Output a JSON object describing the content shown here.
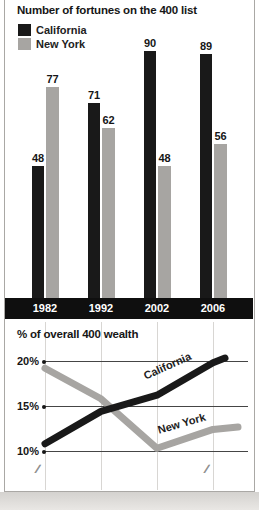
{
  "colors": {
    "california": "#191919",
    "new_york": "#a7a5a2",
    "band": "#0f0f0f",
    "grid_vertical": "#d8d6d3",
    "grid_horizontal": "#454545",
    "card_border": "#aaa8a5"
  },
  "bar_chart": {
    "title": "Number of fortunes on the 400 list",
    "legend": [
      {
        "label": "California"
      },
      {
        "label": "New York"
      }
    ],
    "years": [
      "1982",
      "1992",
      "2002",
      "2006"
    ],
    "california_values": [
      48,
      71,
      90,
      89
    ],
    "new_york_values": [
      77,
      62,
      48,
      56
    ]
  },
  "line_chart": {
    "title": "% of overall 400 wealth",
    "y_ticks": [
      "20%",
      "15%",
      "10%"
    ],
    "california_label": "California",
    "new_york_label": "New York",
    "california_pct": [
      10.8,
      14.4,
      16.2,
      19.8
    ],
    "new_york_pct": [
      19.2,
      15.8,
      10.3,
      12.4
    ],
    "axis_break": "∕∕"
  },
  "chart_data": [
    {
      "type": "bar",
      "title": "Number of fortunes on the 400 list",
      "categories": [
        "1982",
        "1992",
        "2002",
        "2006"
      ],
      "series": [
        {
          "name": "California",
          "values": [
            48,
            71,
            90,
            89
          ],
          "color": "#191919"
        },
        {
          "name": "New York",
          "values": [
            77,
            62,
            48,
            56
          ],
          "color": "#a7a5a2"
        }
      ],
      "ylim": [
        0,
        95
      ],
      "grid": false,
      "legend_position": "top-left",
      "value_labels": true
    },
    {
      "type": "line",
      "title": "% of overall 400 wealth",
      "x": [
        "1982",
        "1992",
        "2002",
        "2006"
      ],
      "series": [
        {
          "name": "California",
          "values": [
            10.8,
            14.4,
            16.2,
            19.8
          ],
          "color": "#191919"
        },
        {
          "name": "New York",
          "values": [
            19.2,
            15.8,
            10.3,
            12.4
          ],
          "color": "#a7a5a2"
        }
      ],
      "ylabel_ticks": [
        "10%",
        "15%",
        "20%"
      ],
      "ylim": [
        9,
        21
      ],
      "grid": true,
      "axis_break": true,
      "legend_position": "inline-labels"
    }
  ]
}
